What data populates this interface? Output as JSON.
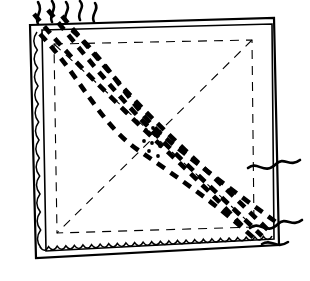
{
  "figure": {
    "kind": "line-art-diagram",
    "width": 310,
    "height": 281,
    "background_color": "#ffffff",
    "ink_color": "#000000"
  },
  "colors": {
    "ink": "#000000",
    "paper": "#ffffff"
  },
  "cloth": {
    "outer_frame": {
      "name": "napkin-outer-edge",
      "stroke_width": 2.2,
      "points": "30,25 274,18 279,245 36,258"
    },
    "hem_frame": {
      "name": "napkin-hem-line",
      "stroke_width": 1.6,
      "points": "42,30 272,24 274,239 46,251"
    },
    "scallop": {
      "name": "scalloped-hem",
      "stroke_width": 1.5,
      "bottom_waves": 27,
      "left_waves": 12,
      "wave_amplitude": 3.2
    }
  },
  "guides": {
    "inner_rectangle": {
      "name": "inner-dashed-rectangle",
      "stroke_width": 1.1,
      "dash": "9 7",
      "points": "54,44 252,40 254,227 57,233"
    },
    "diagonals": [
      {
        "name": "diagonal-tl-br",
        "from": [
          54,
          44
        ],
        "to": [
          254,
          227
        ],
        "dash": "9 7",
        "stroke_width": 1.1
      },
      {
        "name": "diagonal-tr-bl",
        "from": [
          252,
          40
        ],
        "to": [
          57,
          233
        ],
        "dash": "9 7",
        "stroke_width": 1.1
      }
    ]
  },
  "embroidery": {
    "name": "diagonal-dashed-thread-band",
    "description": "Thick dashed strands running corner to corner",
    "stroke_width": 4.6,
    "dash_pattern": "9 7",
    "strand_count": 5,
    "strands": [
      {
        "name": "strand-1",
        "path": "M 34,14 C 70,58 96,82 126,112 C 156,142 196,176 246,230"
      },
      {
        "name": "strand-2",
        "path": "M 48,10 C 84,54 108,84 136,114 C 164,144 210,186 262,236"
      },
      {
        "name": "strand-3",
        "path": "M 62,16 C 92,52 122,88 152,118 C 182,148 226,188 272,234"
      },
      {
        "name": "strand-4",
        "path": "M 72,30 C 112,66 134,112 168,140 C 202,168 240,196 276,222"
      },
      {
        "name": "strand-5",
        "path": "M 40,34 C 80,76 100,124 138,150 C 176,176 222,208 258,242"
      }
    ],
    "center_specks": {
      "name": "center-stipple-cluster",
      "count": 8,
      "radius": 1.9,
      "points": [
        [
          146,
          130
        ],
        [
          153,
          128
        ],
        [
          160,
          133
        ],
        [
          144,
          141
        ],
        [
          152,
          143
        ],
        [
          160,
          146
        ],
        [
          149,
          151
        ],
        [
          158,
          156
        ]
      ]
    }
  },
  "loose_threads": {
    "name": "loose-thread-ends",
    "stroke_width": 2.6,
    "top_ends": [
      {
        "name": "thread-end-top-1",
        "path": "M 38,24 C 34,16 44,12 38,2"
      },
      {
        "name": "thread-end-top-2",
        "path": "M 52,22 C 48,14 58,10 52,1"
      },
      {
        "name": "thread-end-top-3",
        "path": "M 66,22 C 62,14 72,10 66,2"
      },
      {
        "name": "thread-end-top-4",
        "path": "M 80,20 C 76,12 86,8 80,1"
      },
      {
        "name": "thread-end-top-5",
        "path": "M 94,22 C 90,14 100,10 95,3"
      }
    ],
    "right_ends": [
      {
        "name": "thread-end-right-1",
        "path": "M 248,168 C 258,160 264,176 276,164 C 284,156 290,168 300,160"
      },
      {
        "name": "thread-end-right-2",
        "path": "M 250,228 C 260,220 266,236 278,224 C 286,216 292,228 302,220"
      },
      {
        "name": "thread-end-right-3",
        "path": "M 262,244 C 272,238 276,250 288,242"
      }
    ]
  }
}
